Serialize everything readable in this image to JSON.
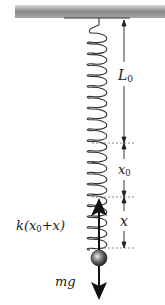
{
  "diagram": {
    "labels": {
      "natural_length": "L",
      "natural_length_sub": "0",
      "static_extension": "x",
      "static_extension_sub": "0",
      "displacement": "x",
      "spring_force_prefix": "k(x",
      "spring_force_sub": "0",
      "spring_force_suffix": "+x)",
      "weight": "mg"
    },
    "colors": {
      "ceiling": "#8a8a8a",
      "spring": "#333333",
      "arrow": "#111111",
      "dashed": "#666666",
      "ball": "#555555"
    }
  }
}
